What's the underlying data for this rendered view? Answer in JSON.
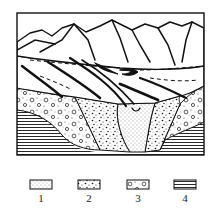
{
  "figure": {
    "type": "geological-cross-section",
    "colors": {
      "ink": "#111111",
      "paper": "#ffffff"
    }
  },
  "legend": {
    "items": [
      {
        "id": 1,
        "label": "1",
        "pattern": "fine-dots"
      },
      {
        "id": 2,
        "label": "2",
        "pattern": "coarse-dots-gravel"
      },
      {
        "id": 3,
        "label": "3",
        "pattern": "dots-with-pebbles"
      },
      {
        "id": 4,
        "label": "4",
        "pattern": "horizontal-lines"
      }
    ]
  }
}
